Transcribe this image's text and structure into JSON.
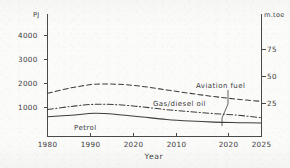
{
  "chart_data": {
    "type": "line",
    "title": "",
    "xlabel": "Year",
    "ylabel": "PJ",
    "y2label": "m.toe",
    "grid": false,
    "legend_position": "inline-annotations",
    "x": [
      1980,
      1985,
      1990,
      1995,
      2000,
      2005,
      2010,
      2015,
      2020,
      2025
    ],
    "xlim": [
      1980,
      2025
    ],
    "ylim": [
      0,
      4600
    ],
    "y2lim": [
      0,
      110
    ],
    "x_tick_labels": [
      "1980",
      "1990",
      "2020",
      "2010",
      "2020",
      "2025"
    ],
    "x_tick_values": [
      1980,
      1990,
      1999,
      2008,
      2019,
      2025
    ],
    "y_tick_labels": [
      "1000",
      "2000",
      "3000",
      "4000"
    ],
    "y_tick_values": [
      1000,
      2000,
      3000,
      4000
    ],
    "y2_tick_labels": [
      "25",
      "50",
      "75"
    ],
    "y2_tick_values": [
      25,
      50,
      75
    ],
    "series": [
      {
        "name": "Aviation fuel",
        "style": "dashed",
        "values": [
          1620,
          1830,
          1960,
          1960,
          1880,
          1750,
          1620,
          1500,
          1400,
          1320
        ]
      },
      {
        "name": "Gas/diesel oil",
        "style": "dash-dot",
        "values": [
          1010,
          1130,
          1210,
          1190,
          1110,
          1010,
          930,
          860,
          800,
          700
        ]
      },
      {
        "name": "Petrol",
        "style": "solid",
        "values": [
          740,
          800,
          870,
          820,
          730,
          640,
          580,
          540,
          520,
          505
        ]
      }
    ],
    "annotations": [
      {
        "text": "Aviation fuel",
        "leader": true
      },
      {
        "text": "Gas/diesel oil",
        "leader": false
      },
      {
        "text": "Petrol",
        "leader": false
      }
    ]
  },
  "axes": {
    "left_unit": "PJ",
    "right_unit": "m.toe",
    "x_title": "Year"
  },
  "colors": {
    "ink": "#3d3d3d",
    "paper": "#fbfbfa"
  }
}
